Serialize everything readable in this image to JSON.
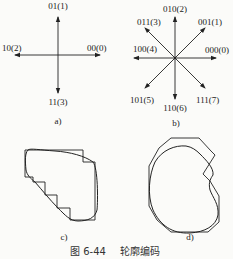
{
  "figure": {
    "caption_number": "图 6-44",
    "caption_title": "轮廓编码",
    "panels": {
      "a": {
        "label": "a)",
        "directions": [
          {
            "code": "00(0)",
            "dir": "right"
          },
          {
            "code": "01(1)",
            "dir": "up"
          },
          {
            "code": "10(2)",
            "dir": "left"
          },
          {
            "code": "11(3)",
            "dir": "down"
          }
        ]
      },
      "b": {
        "label": "b)",
        "directions": [
          {
            "code": "000(0)",
            "dir": "right"
          },
          {
            "code": "001(1)",
            "dir": "up-right"
          },
          {
            "code": "010(2)",
            "dir": "up"
          },
          {
            "code": "011(3)",
            "dir": "up-left"
          },
          {
            "code": "100(4)",
            "dir": "left"
          },
          {
            "code": "101(5)",
            "dir": "down-left"
          },
          {
            "code": "110(6)",
            "dir": "down"
          },
          {
            "code": "111(7)",
            "dir": "down-right"
          }
        ]
      },
      "c": {
        "label": "c)",
        "description": "4-direction chain code approximation of contour"
      },
      "d": {
        "label": "d)",
        "description": "8-direction chain code approximation of contour"
      }
    }
  },
  "colors": {
    "stroke": "#222222",
    "background": "#fbfbf9"
  }
}
